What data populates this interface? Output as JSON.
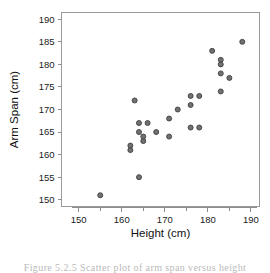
{
  "figure": {
    "caption": "Figure 5.2.5 Scatter plot of arm span versus height"
  },
  "chart_data": {
    "type": "scatter",
    "title": "",
    "xlabel": "Height (cm)",
    "ylabel": "Arm Span (cm)",
    "xlim": [
      146,
      192
    ],
    "ylim": [
      148.5,
      191.5
    ],
    "xticks": [
      150,
      160,
      170,
      180,
      190
    ],
    "yticks": [
      150,
      155,
      160,
      165,
      170,
      175,
      180,
      185,
      190
    ],
    "grid": false,
    "legend": null,
    "point_color": "#717171",
    "point_edge_color": "#3f3f3f",
    "points": [
      {
        "x": 155,
        "y": 151
      },
      {
        "x": 162,
        "y": 162
      },
      {
        "x": 162,
        "y": 161
      },
      {
        "x": 163,
        "y": 172
      },
      {
        "x": 164,
        "y": 167
      },
      {
        "x": 164,
        "y": 165
      },
      {
        "x": 164,
        "y": 155
      },
      {
        "x": 165,
        "y": 163
      },
      {
        "x": 165,
        "y": 164
      },
      {
        "x": 166,
        "y": 167
      },
      {
        "x": 168,
        "y": 165
      },
      {
        "x": 171,
        "y": 168
      },
      {
        "x": 171,
        "y": 164
      },
      {
        "x": 173,
        "y": 170
      },
      {
        "x": 176,
        "y": 173
      },
      {
        "x": 176,
        "y": 171
      },
      {
        "x": 176,
        "y": 166
      },
      {
        "x": 178,
        "y": 173
      },
      {
        "x": 178,
        "y": 166
      },
      {
        "x": 181,
        "y": 183
      },
      {
        "x": 183,
        "y": 181
      },
      {
        "x": 183,
        "y": 180
      },
      {
        "x": 183,
        "y": 178
      },
      {
        "x": 183,
        "y": 174
      },
      {
        "x": 185,
        "y": 177
      },
      {
        "x": 188,
        "y": 185
      }
    ]
  }
}
